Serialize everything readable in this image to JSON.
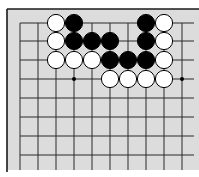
{
  "board": {
    "type": "go-diagram",
    "background": "#dcdcdc",
    "line_color": "#2a2a2a",
    "border_color": "#1a1a1a",
    "columns_x": [
      20,
      38,
      56,
      74,
      92,
      110,
      128,
      146,
      164,
      182
    ],
    "rows_y": [
      23,
      41,
      60,
      79,
      98,
      117,
      136,
      155
    ],
    "grid_bottom": 170,
    "grid_right": 194,
    "left_edge_x": 7,
    "top_edge_y": 9,
    "stone_radius": 8.6,
    "star_points": [
      [
        3,
        3
      ],
      [
        9,
        3
      ]
    ],
    "stones": [
      {
        "color": "white",
        "col": 2,
        "row": 0
      },
      {
        "color": "black",
        "col": 3,
        "row": 0
      },
      {
        "color": "black",
        "col": 7,
        "row": 0
      },
      {
        "color": "white",
        "col": 8,
        "row": 0
      },
      {
        "color": "white",
        "col": 2,
        "row": 1
      },
      {
        "color": "black",
        "col": 3,
        "row": 1
      },
      {
        "color": "black",
        "col": 4,
        "row": 1
      },
      {
        "color": "black",
        "col": 5,
        "row": 1
      },
      {
        "color": "black",
        "col": 7,
        "row": 1
      },
      {
        "color": "white",
        "col": 8,
        "row": 1
      },
      {
        "color": "white",
        "col": 2,
        "row": 2
      },
      {
        "color": "white",
        "col": 3,
        "row": 2
      },
      {
        "color": "white",
        "col": 4,
        "row": 2
      },
      {
        "color": "black",
        "col": 5,
        "row": 2
      },
      {
        "color": "black",
        "col": 6,
        "row": 2
      },
      {
        "color": "black",
        "col": 7,
        "row": 2
      },
      {
        "color": "white",
        "col": 8,
        "row": 2
      },
      {
        "color": "white",
        "col": 5,
        "row": 3
      },
      {
        "color": "white",
        "col": 6,
        "row": 3
      },
      {
        "color": "white",
        "col": 7,
        "row": 3
      },
      {
        "color": "white",
        "col": 8,
        "row": 3
      }
    ]
  }
}
